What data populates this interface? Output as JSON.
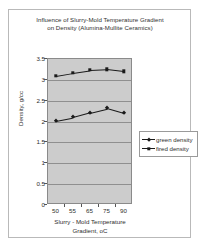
{
  "chart_data": {
    "type": "line",
    "title": "Influence of Slurry-Mold Temperature Gradient on Density (Alumina-Mullite Ceramics)",
    "title_line1": "Influence of Slurry-Mold Temperature Gradient",
    "title_line2": "on Density (Alumina-Mullite Ceramics)",
    "xlabel": "Slurry - Mold Temperature Gradient, oC",
    "xlabel_line1": "Slurry - Mold Temperature",
    "xlabel_line2": "Gradient, oC",
    "ylabel": "Density, g/cc",
    "categories": [
      "50",
      "55",
      "65",
      "75",
      "90"
    ],
    "x_tick_labels": [
      "50",
      "55",
      "65",
      "75",
      "90"
    ],
    "y_tick_labels": [
      "3.5",
      "3",
      "2.5",
      "2",
      "1.5",
      "1",
      "0.5",
      "0"
    ],
    "y_tick_values": [
      3.5,
      3,
      2.5,
      2,
      1.5,
      1,
      0.5,
      0
    ],
    "ylim": [
      0,
      3.5
    ],
    "grid": true,
    "legend_position": "right",
    "plot_background": "#cccccc",
    "series_color": "#1a1a1a",
    "series": [
      {
        "name": "green density",
        "marker": "diamond",
        "values": [
          2.0,
          2.08,
          2.19,
          2.29,
          2.17
        ]
      },
      {
        "name": "fired density",
        "marker": "square",
        "values": [
          3.08,
          3.15,
          3.21,
          3.23,
          3.18
        ]
      }
    ]
  },
  "legend": {
    "items": [
      {
        "label": "green density",
        "marker": "diamond"
      },
      {
        "label": "fired density",
        "marker": "square"
      }
    ]
  }
}
